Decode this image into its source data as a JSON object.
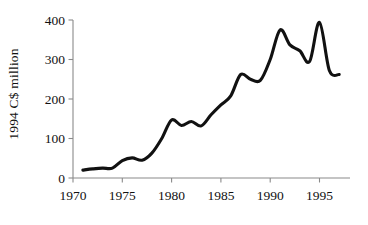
{
  "chart_data": {
    "type": "line",
    "title": "",
    "xlabel": "",
    "ylabel": "1994 C$ million",
    "xlim": [
      1970,
      1997.5
    ],
    "ylim": [
      0,
      400
    ],
    "grid": false,
    "legend": "none",
    "xticks": [
      "1970",
      "1975",
      "1980",
      "1985",
      "1990",
      "1995"
    ],
    "xtick_values": [
      1970,
      1975,
      1980,
      1985,
      1990,
      1995
    ],
    "yticks": [
      "0",
      "100",
      "200",
      "300",
      "400"
    ],
    "ytick_values": [
      0,
      100,
      200,
      300,
      400
    ],
    "series": [
      {
        "name": "1994 C$ million",
        "color": "#111111",
        "x": [
          1971,
          1972,
          1973,
          1974,
          1975,
          1976,
          1977,
          1978,
          1979,
          1980,
          1981,
          1982,
          1983,
          1984,
          1985,
          1986,
          1987,
          1988,
          1989,
          1990,
          1991,
          1992,
          1993,
          1994,
          1995,
          1996,
          1997
        ],
        "values": [
          20,
          23,
          25,
          25,
          44,
          51,
          45,
          63,
          100,
          147,
          133,
          143,
          132,
          160,
          185,
          208,
          262,
          250,
          247,
          300,
          375,
          337,
          322,
          295,
          394,
          272,
          262
        ]
      }
    ]
  },
  "axis_title": {
    "y": "1994 C$ million"
  }
}
